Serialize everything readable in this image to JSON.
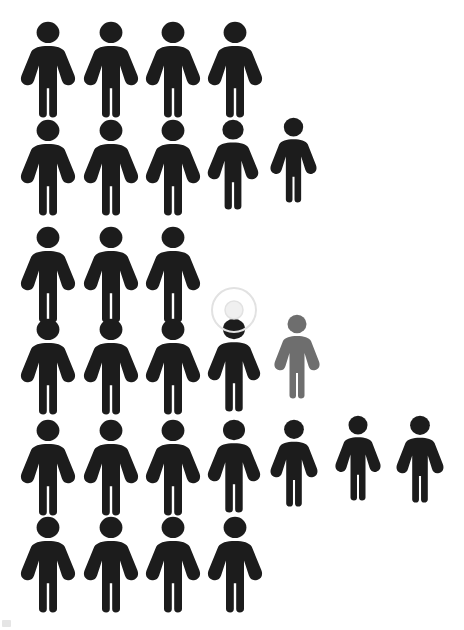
{
  "canvas": {
    "width": 464,
    "height": 630,
    "background": "#ffffff"
  },
  "palette": {
    "primary": "#1c1c1c",
    "highlight": "#6e6e6e",
    "marker_ring": "#e2e2e2",
    "smudge": "#dcdcdc"
  },
  "legend": {
    "primary_label": "person",
    "highlight_label": "highlighted person"
  },
  "marker": {
    "icon": "target-ring-icon",
    "cx": 234,
    "cy": 310,
    "outer_r": 22,
    "inner_r": 9
  },
  "chart_data": {
    "type": "pictogram",
    "title": "",
    "subtitle": "",
    "xlabel": "",
    "ylabel": "",
    "unit_value": 1,
    "icon": "person-icon",
    "total_icons": 27,
    "counts_by_color": {
      "#1c1c1c": 26,
      "#6e6e6e": 1
    },
    "rows": [
      {
        "row": 1,
        "count": 4,
        "colors": [
          "#1c1c1c",
          "#1c1c1c",
          "#1c1c1c",
          "#1c1c1c"
        ]
      },
      {
        "row": 2,
        "count": 5,
        "colors": [
          "#1c1c1c",
          "#1c1c1c",
          "#1c1c1c",
          "#1c1c1c",
          "#1c1c1c"
        ]
      },
      {
        "row": 3,
        "count": 3,
        "colors": [
          "#1c1c1c",
          "#1c1c1c",
          "#1c1c1c"
        ]
      },
      {
        "row": 4,
        "count": 5,
        "colors": [
          "#1c1c1c",
          "#1c1c1c",
          "#1c1c1c",
          "#1c1c1c",
          "#6e6e6e"
        ]
      },
      {
        "row": 5,
        "count": 7,
        "colors": [
          "#1c1c1c",
          "#1c1c1c",
          "#1c1c1c",
          "#1c1c1c",
          "#1c1c1c",
          "#1c1c1c",
          "#1c1c1c"
        ]
      },
      {
        "row": 6,
        "count": 4,
        "colors": [
          "#1c1c1c",
          "#1c1c1c",
          "#1c1c1c",
          "#1c1c1c"
        ]
      }
    ],
    "figures": [
      {
        "id": 1,
        "row": 1,
        "col": 1,
        "x": 18,
        "y": 21,
        "w": 60,
        "h": 97,
        "color": "#1c1c1c"
      },
      {
        "id": 2,
        "row": 1,
        "col": 2,
        "x": 81,
        "y": 21,
        "w": 60,
        "h": 97,
        "color": "#1c1c1c"
      },
      {
        "id": 3,
        "row": 1,
        "col": 3,
        "x": 143,
        "y": 21,
        "w": 60,
        "h": 97,
        "color": "#1c1c1c"
      },
      {
        "id": 4,
        "row": 1,
        "col": 4,
        "x": 205,
        "y": 21,
        "w": 60,
        "h": 97,
        "color": "#1c1c1c"
      },
      {
        "id": 5,
        "row": 2,
        "col": 1,
        "x": 18,
        "y": 119,
        "w": 60,
        "h": 97,
        "color": "#1c1c1c"
      },
      {
        "id": 6,
        "row": 2,
        "col": 2,
        "x": 81,
        "y": 119,
        "w": 60,
        "h": 97,
        "color": "#1c1c1c"
      },
      {
        "id": 7,
        "row": 2,
        "col": 3,
        "x": 143,
        "y": 119,
        "w": 60,
        "h": 97,
        "color": "#1c1c1c"
      },
      {
        "id": 8,
        "row": 2,
        "col": 4,
        "x": 205,
        "y": 119,
        "w": 56,
        "h": 91,
        "color": "#1c1c1c"
      },
      {
        "id": 9,
        "row": 2,
        "col": 5,
        "x": 268,
        "y": 117,
        "w": 51,
        "h": 86,
        "color": "#1c1c1c"
      },
      {
        "id": 10,
        "row": 3,
        "col": 1,
        "x": 18,
        "y": 226,
        "w": 60,
        "h": 97,
        "color": "#1c1c1c"
      },
      {
        "id": 11,
        "row": 3,
        "col": 2,
        "x": 81,
        "y": 226,
        "w": 60,
        "h": 97,
        "color": "#1c1c1c"
      },
      {
        "id": 12,
        "row": 3,
        "col": 3,
        "x": 143,
        "y": 226,
        "w": 60,
        "h": 97,
        "color": "#1c1c1c"
      },
      {
        "id": 13,
        "row": 4,
        "col": 1,
        "x": 18,
        "y": 318,
        "w": 60,
        "h": 97,
        "color": "#1c1c1c"
      },
      {
        "id": 14,
        "row": 4,
        "col": 2,
        "x": 81,
        "y": 318,
        "w": 60,
        "h": 97,
        "color": "#1c1c1c"
      },
      {
        "id": 15,
        "row": 4,
        "col": 3,
        "x": 143,
        "y": 318,
        "w": 60,
        "h": 97,
        "color": "#1c1c1c"
      },
      {
        "id": 16,
        "row": 4,
        "col": 4,
        "x": 205,
        "y": 318,
        "w": 58,
        "h": 94,
        "color": "#1c1c1c"
      },
      {
        "id": 17,
        "row": 4,
        "col": 5,
        "x": 272,
        "y": 314,
        "w": 50,
        "h": 85,
        "color": "#6e6e6e"
      },
      {
        "id": 18,
        "row": 5,
        "col": 1,
        "x": 18,
        "y": 419,
        "w": 60,
        "h": 97,
        "color": "#1c1c1c"
      },
      {
        "id": 19,
        "row": 5,
        "col": 2,
        "x": 81,
        "y": 419,
        "w": 60,
        "h": 97,
        "color": "#1c1c1c"
      },
      {
        "id": 20,
        "row": 5,
        "col": 3,
        "x": 143,
        "y": 419,
        "w": 60,
        "h": 97,
        "color": "#1c1c1c"
      },
      {
        "id": 21,
        "row": 5,
        "col": 4,
        "x": 205,
        "y": 419,
        "w": 58,
        "h": 94,
        "color": "#1c1c1c"
      },
      {
        "id": 22,
        "row": 5,
        "col": 5,
        "x": 268,
        "y": 419,
        "w": 52,
        "h": 88,
        "color": "#1c1c1c"
      },
      {
        "id": 23,
        "row": 5,
        "col": 6,
        "x": 333,
        "y": 415,
        "w": 50,
        "h": 86,
        "color": "#1c1c1c"
      },
      {
        "id": 24,
        "row": 5,
        "col": 7,
        "x": 394,
        "y": 415,
        "w": 52,
        "h": 88,
        "color": "#1c1c1c"
      },
      {
        "id": 25,
        "row": 6,
        "col": 1,
        "x": 18,
        "y": 516,
        "w": 60,
        "h": 97,
        "color": "#1c1c1c"
      },
      {
        "id": 26,
        "row": 6,
        "col": 2,
        "x": 81,
        "y": 516,
        "w": 60,
        "h": 97,
        "color": "#1c1c1c"
      },
      {
        "id": 27,
        "row": 6,
        "col": 3,
        "x": 143,
        "y": 516,
        "w": 60,
        "h": 97,
        "color": "#1c1c1c"
      },
      {
        "id": 28,
        "row": 6,
        "col": 4,
        "x": 205,
        "y": 516,
        "w": 60,
        "h": 97,
        "color": "#1c1c1c"
      }
    ]
  }
}
